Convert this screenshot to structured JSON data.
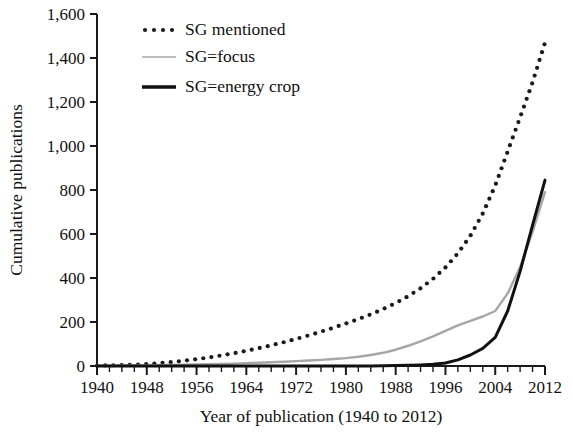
{
  "chart_data": {
    "type": "line",
    "title": "",
    "xlabel": "Year of publication (1940 to 2012)",
    "ylabel": "Cumulative publications",
    "xlim": [
      1940,
      2012
    ],
    "ylim": [
      0,
      1600
    ],
    "xticks": [
      1940,
      1948,
      1956,
      1964,
      1972,
      1980,
      1988,
      1996,
      2004,
      2012
    ],
    "xtick_labels": [
      "1940",
      "1948",
      "1956",
      "1964",
      "1972",
      "1980",
      "1988",
      "1996",
      "2004",
      "2012"
    ],
    "yticks": [
      0,
      200,
      400,
      600,
      800,
      1000,
      1200,
      1400,
      1600
    ],
    "ytick_labels": [
      "0",
      "200",
      "400",
      "600",
      "800",
      "1,000",
      "1,200",
      "1,400",
      "1,600"
    ],
    "grid": false,
    "legend_position": "top-left",
    "x": [
      1940,
      1942,
      1944,
      1946,
      1948,
      1950,
      1952,
      1954,
      1956,
      1958,
      1960,
      1962,
      1964,
      1966,
      1968,
      1970,
      1972,
      1974,
      1976,
      1978,
      1980,
      1982,
      1984,
      1986,
      1988,
      1990,
      1992,
      1994,
      1996,
      1998,
      2000,
      2002,
      2004,
      2006,
      2008,
      2010,
      2012
    ],
    "series": [
      {
        "name": "SG mentioned",
        "style": "dotted",
        "color": "#1a1a1a",
        "values": [
          2,
          3,
          4,
          6,
          9,
          13,
          18,
          24,
          31,
          39,
          48,
          58,
          69,
          81,
          94,
          108,
          123,
          139,
          156,
          174,
          193,
          213,
          235,
          259,
          286,
          317,
          353,
          396,
          448,
          512,
          592,
          693,
          820,
          975,
          1130,
          1290,
          1470
        ]
      },
      {
        "name": "SG=focus",
        "style": "solid-light",
        "color": "#a6a6a6",
        "values": [
          1,
          1,
          2,
          2,
          3,
          4,
          5,
          6,
          7,
          8,
          9,
          11,
          13,
          15,
          17,
          19,
          22,
          25,
          28,
          32,
          36,
          42,
          50,
          60,
          74,
          92,
          112,
          135,
          160,
          185,
          205,
          225,
          250,
          330,
          450,
          610,
          790
        ]
      },
      {
        "name": "SG=energy crop",
        "style": "solid-bold",
        "color": "#111111",
        "values": [
          0,
          0,
          0,
          0,
          0,
          0,
          0,
          0,
          0,
          0,
          0,
          0,
          0,
          0,
          0,
          0,
          0,
          0,
          0,
          0,
          0,
          0,
          0,
          1,
          2,
          3,
          5,
          8,
          14,
          28,
          50,
          80,
          130,
          250,
          430,
          640,
          845
        ]
      }
    ]
  },
  "legend": {
    "items": [
      {
        "label": "SG mentioned",
        "swatch": "dotted-line-swatch"
      },
      {
        "label": "SG=focus",
        "swatch": "gray-line-swatch"
      },
      {
        "label": "SG=energy crop",
        "swatch": "black-line-swatch"
      }
    ]
  },
  "colors": {
    "mentioned": "#1a1a1a",
    "focus": "#a6a6a6",
    "energy_crop": "#111111",
    "axis": "#1a1a1a",
    "background": "#ffffff"
  }
}
